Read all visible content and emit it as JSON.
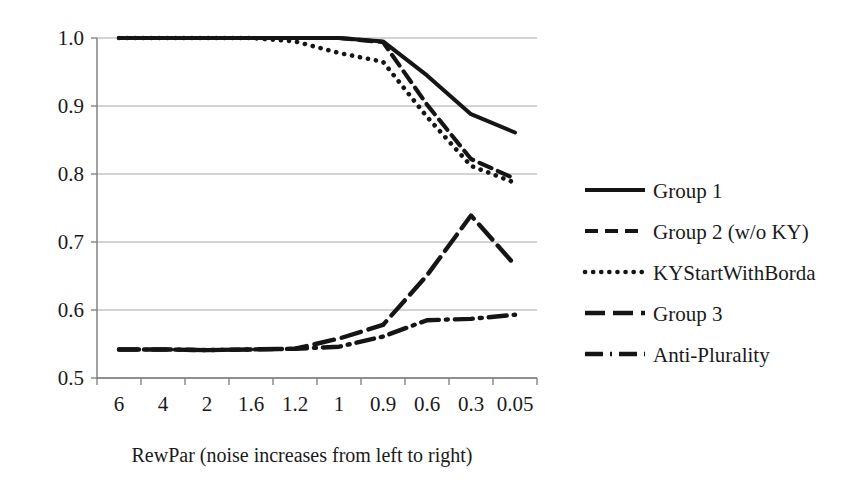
{
  "chart_data": {
    "type": "line",
    "title": "",
    "xlabel": "RewPar (noise increases from left to right)",
    "ylabel": "",
    "categories": [
      "6",
      "4",
      "2",
      "1.6",
      "1.2",
      "1",
      "0.9",
      "0.6",
      "0.3",
      "0.05"
    ],
    "ylim": [
      0.5,
      1.0
    ],
    "yticks": [
      "0.5",
      "0.6",
      "0.7",
      "0.8",
      "0.9",
      "1.0"
    ],
    "grid": true,
    "legend_position": "right",
    "series": [
      {
        "name": "Group 1",
        "style": "solid",
        "values": [
          1.0,
          1.0,
          1.0,
          1.0,
          1.0,
          1.0,
          0.995,
          0.945,
          0.888,
          0.861
        ]
      },
      {
        "name": "Group 2 (w/o KY)",
        "style": "dashed",
        "values": [
          1.0,
          1.0,
          1.0,
          1.0,
          1.0,
          1.0,
          0.994,
          0.902,
          0.822,
          0.793
        ]
      },
      {
        "name": "KYStartWithBorda",
        "style": "dotted",
        "values": [
          1.0,
          1.0,
          1.0,
          1.0,
          0.995,
          0.978,
          0.965,
          0.884,
          0.812,
          0.787
        ]
      },
      {
        "name": "Group 3",
        "style": "longdash",
        "values": [
          0.542,
          0.542,
          0.541,
          0.542,
          0.543,
          0.558,
          0.578,
          0.651,
          0.739,
          0.666
        ]
      },
      {
        "name": "Anti-Plurality",
        "style": "dashdot",
        "values": [
          0.542,
          0.542,
          0.541,
          0.542,
          0.543,
          0.546,
          0.561,
          0.585,
          0.587,
          0.593
        ]
      }
    ]
  },
  "legend": {
    "items": [
      {
        "label": "Group 1"
      },
      {
        "label": "Group 2 (w/o KY)"
      },
      {
        "label": "KYStartWithBorda"
      },
      {
        "label": "Group 3"
      },
      {
        "label": "Anti-Plurality"
      }
    ]
  },
  "colors": {
    "ink": "#151515",
    "grid": "#a8a8a8",
    "axis": "#7a7a7a",
    "background": "#ffffff"
  }
}
